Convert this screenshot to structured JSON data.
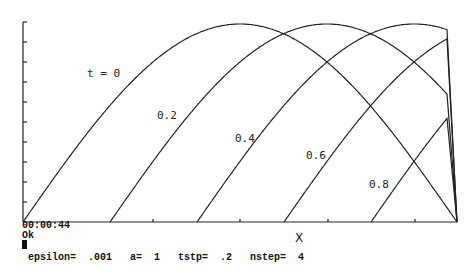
{
  "chart_data": {
    "type": "line",
    "title": "",
    "xlabel": "X",
    "ylabel": "",
    "grid": false,
    "legend": "inline labels",
    "curve_model": "half-sine wave traveling right, truncated at right boundary",
    "series": [
      {
        "name": "t = 0",
        "label": "t = 0",
        "start_x_px": 23,
        "label_pos": [
          87,
          67
        ]
      },
      {
        "name": "0.2",
        "label": "0.2",
        "start_x_px": 110,
        "label_pos": [
          157,
          109
        ]
      },
      {
        "name": "0.4",
        "label": "0.4",
        "start_x_px": 197,
        "label_pos": [
          235,
          132
        ]
      },
      {
        "name": "0.6",
        "label": "0.6",
        "start_x_px": 284,
        "label_pos": [
          306,
          149
        ]
      },
      {
        "name": "0.8",
        "label": "0.8",
        "start_x_px": 371,
        "label_pos": [
          369,
          178
        ]
      }
    ],
    "axes": {
      "origin_px": [
        23,
        222
      ],
      "y_top_px": 22,
      "x_right_px": 457,
      "wave_width_px": 434,
      "amplitude_px": 198,
      "right_cut_px": 447,
      "y_ticks": 10,
      "x_ticks_px": [
        153,
        240,
        328,
        415
      ]
    }
  },
  "status": {
    "elapsed": "00:00:44",
    "message": "Ok",
    "params_line": "epsilon=  .001   a=  1   tstp=  .2   nstep=  4"
  },
  "params": {
    "epsilon": ".001",
    "a": "1",
    "tstp": ".2",
    "nstep": "4"
  }
}
